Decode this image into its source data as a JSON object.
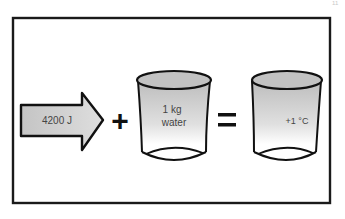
{
  "page_mark": "11",
  "diagram": {
    "arrow": {
      "label": "4200 J"
    },
    "operator_plus": "+",
    "beaker_1": {
      "line1": "1 kg",
      "line2": "water"
    },
    "operator_equals": "=",
    "beaker_2": {
      "label": "+1 °C"
    }
  }
}
